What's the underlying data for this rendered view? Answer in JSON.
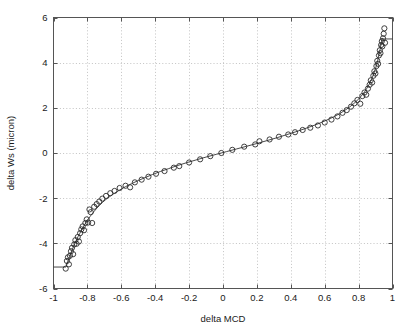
{
  "chart_data": {
    "type": "scatter",
    "title": "",
    "xlabel": "delta MCD",
    "ylabel": "delta Ws (micron)",
    "xlim": [
      -1,
      1
    ],
    "ylim": [
      -6,
      6
    ],
    "grid": true,
    "grid_style": "dotted",
    "legend": "none",
    "marker": "open-circle",
    "xticks": [
      -1,
      -0.8,
      -0.6,
      -0.4,
      -0.2,
      0,
      0.2,
      0.4,
      0.6,
      0.8,
      1
    ],
    "xticklabels": [
      "-1",
      "-0.8",
      "-0.6",
      "-0.4",
      "-0.2",
      "0",
      "0.2",
      "0.4",
      "0.6",
      "0.8",
      "1"
    ],
    "yticks": [
      -6,
      -4,
      -2,
      0,
      2,
      4,
      6
    ],
    "yticklabels": [
      "-6",
      "-4",
      "-2",
      "0",
      "2",
      "4",
      "6"
    ],
    "series": [
      {
        "name": "measured",
        "type": "scatter",
        "marker": "open-circle",
        "color": "#2b2b2b",
        "points": [
          [
            -0.928,
            -5.12
          ],
          [
            -0.921,
            -4.78
          ],
          [
            -0.915,
            -4.62
          ],
          [
            -0.909,
            -4.93
          ],
          [
            -0.903,
            -4.55
          ],
          [
            -0.897,
            -4.35
          ],
          [
            -0.891,
            -4.2
          ],
          [
            -0.884,
            -4.48
          ],
          [
            -0.878,
            -4.05
          ],
          [
            -0.871,
            -3.86
          ],
          [
            -0.864,
            -4.02
          ],
          [
            -0.857,
            -3.72
          ],
          [
            -0.85,
            -3.92
          ],
          [
            -0.843,
            -3.55
          ],
          [
            -0.836,
            -3.38
          ],
          [
            -0.828,
            -3.25
          ],
          [
            -0.82,
            -3.42
          ],
          [
            -0.812,
            -3.1
          ],
          [
            -0.804,
            -2.94
          ],
          [
            -0.796,
            -3.08
          ],
          [
            -0.788,
            -2.5
          ],
          [
            -0.78,
            -2.62
          ],
          [
            -0.772,
            -3.1
          ],
          [
            -0.76,
            -2.38
          ],
          [
            -0.745,
            -2.26
          ],
          [
            -0.73,
            -2.15
          ],
          [
            -0.712,
            -2.02
          ],
          [
            -0.69,
            -1.9
          ],
          [
            -0.665,
            -1.78
          ],
          [
            -0.64,
            -1.68
          ],
          [
            -0.61,
            -1.55
          ],
          [
            -0.575,
            -1.45
          ],
          [
            -0.548,
            -1.52
          ],
          [
            -0.52,
            -1.3
          ],
          [
            -0.48,
            -1.18
          ],
          [
            -0.44,
            -1.05
          ],
          [
            -0.395,
            -0.92
          ],
          [
            -0.345,
            -0.8
          ],
          [
            -0.29,
            -0.65
          ],
          [
            -0.258,
            -0.58
          ],
          [
            -0.2,
            -0.42
          ],
          [
            -0.135,
            -0.28
          ],
          [
            -0.075,
            -0.14
          ],
          [
            -0.01,
            0.0
          ],
          [
            0.055,
            0.14
          ],
          [
            0.125,
            0.28
          ],
          [
            0.19,
            0.38
          ],
          [
            0.215,
            0.52
          ],
          [
            0.275,
            0.6
          ],
          [
            0.33,
            0.72
          ],
          [
            0.385,
            0.82
          ],
          [
            0.425,
            0.92
          ],
          [
            0.47,
            1.02
          ],
          [
            0.515,
            1.12
          ],
          [
            0.56,
            1.22
          ],
          [
            0.6,
            1.35
          ],
          [
            0.64,
            1.48
          ],
          [
            0.675,
            1.62
          ],
          [
            0.705,
            1.78
          ],
          [
            0.73,
            1.9
          ],
          [
            0.755,
            2.05
          ],
          [
            0.775,
            2.2
          ],
          [
            0.793,
            2.35
          ],
          [
            0.81,
            2.18
          ],
          [
            0.822,
            2.52
          ],
          [
            0.835,
            2.68
          ],
          [
            0.845,
            2.58
          ],
          [
            0.855,
            2.85
          ],
          [
            0.865,
            3.02
          ],
          [
            0.872,
            3.22
          ],
          [
            0.88,
            3.12
          ],
          [
            0.887,
            3.42
          ],
          [
            0.893,
            3.62
          ],
          [
            0.899,
            3.52
          ],
          [
            0.905,
            3.85
          ],
          [
            0.91,
            4.08
          ],
          [
            0.915,
            3.95
          ],
          [
            0.92,
            4.32
          ],
          [
            0.925,
            4.55
          ],
          [
            0.929,
            4.42
          ],
          [
            0.933,
            4.78
          ],
          [
            0.937,
            4.95
          ],
          [
            0.94,
            4.72
          ],
          [
            0.944,
            5.08
          ],
          [
            0.948,
            5.28
          ],
          [
            0.952,
            5.52
          ],
          [
            0.956,
            4.88
          ]
        ]
      },
      {
        "name": "fit",
        "type": "line",
        "color": "#333333",
        "points": [
          [
            -0.93,
            -5.05
          ],
          [
            -0.925,
            -5.02
          ],
          [
            -0.915,
            -4.8
          ],
          [
            -0.905,
            -4.58
          ],
          [
            -0.895,
            -4.38
          ],
          [
            -0.885,
            -4.2
          ],
          [
            -0.875,
            -4.02
          ],
          [
            -0.865,
            -3.86
          ],
          [
            -0.855,
            -3.7
          ],
          [
            -0.845,
            -3.56
          ],
          [
            -0.835,
            -3.42
          ],
          [
            -0.825,
            -3.29
          ],
          [
            -0.815,
            -3.16
          ],
          [
            -0.805,
            -3.04
          ],
          [
            -0.795,
            -2.93
          ],
          [
            -0.785,
            -2.82
          ],
          [
            -0.775,
            -2.72
          ],
          [
            -0.76,
            -2.58
          ],
          [
            -0.745,
            -2.45
          ],
          [
            -0.73,
            -2.33
          ],
          [
            -0.71,
            -2.18
          ],
          [
            -0.69,
            -2.05
          ],
          [
            -0.665,
            -1.91
          ],
          [
            -0.64,
            -1.78
          ],
          [
            -0.61,
            -1.64
          ],
          [
            -0.575,
            -1.49
          ],
          [
            -0.54,
            -1.36
          ],
          [
            -0.5,
            -1.22
          ],
          [
            -0.46,
            -1.09
          ],
          [
            -0.415,
            -0.95
          ],
          [
            -0.37,
            -0.82
          ],
          [
            -0.32,
            -0.69
          ],
          [
            -0.27,
            -0.56
          ],
          [
            -0.215,
            -0.43
          ],
          [
            -0.16,
            -0.31
          ],
          [
            -0.1,
            -0.18
          ],
          [
            -0.04,
            -0.06
          ],
          [
            0.02,
            0.06
          ],
          [
            0.08,
            0.18
          ],
          [
            0.14,
            0.3
          ],
          [
            0.2,
            0.42
          ],
          [
            0.26,
            0.55
          ],
          [
            0.32,
            0.68
          ],
          [
            0.375,
            0.81
          ],
          [
            0.43,
            0.94
          ],
          [
            0.48,
            1.07
          ],
          [
            0.525,
            1.19
          ],
          [
            0.57,
            1.32
          ],
          [
            0.61,
            1.45
          ],
          [
            0.65,
            1.59
          ],
          [
            0.685,
            1.73
          ],
          [
            0.715,
            1.87
          ],
          [
            0.742,
            2.01
          ],
          [
            0.766,
            2.15
          ],
          [
            0.788,
            2.3
          ],
          [
            0.806,
            2.44
          ],
          [
            0.822,
            2.58
          ],
          [
            0.836,
            2.72
          ],
          [
            0.849,
            2.87
          ],
          [
            0.86,
            3.01
          ],
          [
            0.87,
            3.16
          ],
          [
            0.879,
            3.31
          ],
          [
            0.887,
            3.46
          ],
          [
            0.894,
            3.61
          ],
          [
            0.901,
            3.77
          ],
          [
            0.907,
            3.93
          ],
          [
            0.912,
            4.08
          ],
          [
            0.917,
            4.24
          ],
          [
            0.922,
            4.41
          ],
          [
            0.927,
            4.59
          ],
          [
            0.931,
            4.75
          ],
          [
            0.935,
            4.92
          ],
          [
            0.939,
            5.08
          ]
        ]
      },
      {
        "name": "upper-clip",
        "type": "hline",
        "color": "#333333",
        "y": 5.05,
        "x_start": 0.935,
        "x_end": 1.0
      },
      {
        "name": "lower-clip",
        "type": "hline",
        "color": "#333333",
        "y": -5.05,
        "x_start": -1.0,
        "x_end": -0.93
      }
    ]
  }
}
